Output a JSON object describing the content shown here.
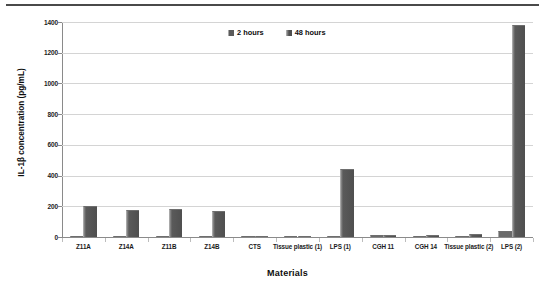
{
  "chart_data": {
    "type": "bar",
    "title": "",
    "xlabel": "Materials",
    "ylabel": "IL-1β concentration (pg/mL)",
    "ylim": [
      0,
      1400
    ],
    "yticks": [
      0,
      200,
      400,
      600,
      800,
      1000,
      1200,
      1400
    ],
    "ytick_labels": [
      "0",
      "200",
      "400",
      "600",
      "800",
      "1000",
      "1200",
      "1400"
    ],
    "grid": true,
    "legend_position": "top-center",
    "categories": [
      "Z11A",
      "Z14A",
      "Z11B",
      "Z14B",
      "CTS",
      "Tissue plastic (1)",
      "LPS (1)",
      "CGH 11",
      "CGH 14",
      "Tissue plastic (2)",
      "LPS (2)"
    ],
    "series": [
      {
        "name": "2 hours",
        "color": "#6a6a6a",
        "values": [
          8,
          4,
          3,
          5,
          2,
          1,
          4,
          10,
          7,
          5,
          38
        ]
      },
      {
        "name": "48 hours",
        "color": "#4f4f4f",
        "values": [
          200,
          175,
          180,
          172,
          6,
          3,
          440,
          14,
          10,
          18,
          1380
        ]
      }
    ]
  },
  "axes": {
    "y_title": "IL-1β concentration (pg/mL)",
    "x_title": "Materials"
  },
  "legend": {
    "items": [
      {
        "label": "2 hours",
        "swatch": "legend-swatch-2-hours"
      },
      {
        "label": "48 hours",
        "swatch": "legend-swatch-48-hours"
      }
    ]
  },
  "colors": {
    "bar_2h": "#6a6a6a",
    "bar_48h": "#4f4f4f",
    "gridline": "#d4d4d4",
    "axis": "#8a8a8a",
    "text": "#0d0d0d",
    "background": "#ffffff"
  }
}
